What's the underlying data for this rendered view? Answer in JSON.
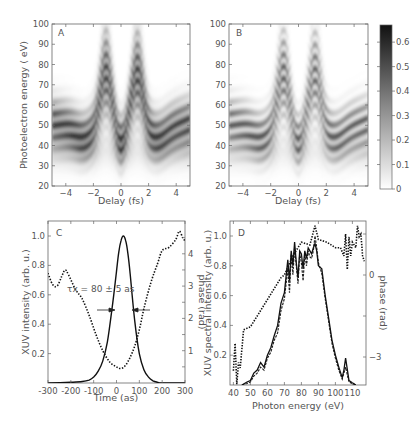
{
  "chart_data": [
    {
      "panel": "A",
      "type": "heatmap",
      "xlabel": "Delay (fs)",
      "ylabel": "Photoelectron energy ( eV)",
      "xlim": [
        -5,
        5
      ],
      "ylim": [
        20,
        100
      ],
      "xticks": [
        -4,
        -2,
        0,
        2,
        4
      ],
      "yticks": [
        20,
        30,
        40,
        50,
        60,
        70,
        80,
        90,
        100
      ],
      "description": "Measured streaking spectrogram: band centred ~55 eV oscillating with delay, peaks reaching ~88 eV near -1 fs and +1 fs, dip near 0 fs and minima ~40 eV",
      "peaks_delay_fs": [
        -1.1,
        1.2
      ],
      "peak_energy_eV": 88,
      "band_center_eV": 55
    },
    {
      "panel": "B",
      "type": "heatmap",
      "xlabel": "Delay (fs)",
      "ylabel": "",
      "xlim": [
        -5,
        5
      ],
      "ylim": [
        20,
        100
      ],
      "xticks": [
        -4,
        -2,
        0,
        2,
        4
      ],
      "yticks": [
        20,
        30,
        40,
        50,
        60,
        70,
        80,
        90,
        100
      ],
      "description": "Reconstructed streaking spectrogram with similar oscillation structure",
      "peaks_delay_fs": [
        -1.1,
        1.2
      ],
      "peak_energy_eV": 86,
      "band_center_eV": 55,
      "colorbar": {
        "range": [
          0,
          0.67
        ],
        "ticks": [
          0,
          0.1,
          0.2,
          0.3,
          0.4,
          0.5,
          0.6
        ]
      }
    },
    {
      "panel": "C",
      "type": "line",
      "xlabel": "Time (as)",
      "ylabel": "XUV intensity (arb. u.)",
      "y2label": "phase (rad)",
      "xlim": [
        -300,
        300
      ],
      "ylim": [
        0,
        1.1
      ],
      "y2lim": [
        0,
        4.75
      ],
      "xticks": [
        -300,
        -200,
        -100,
        0,
        100,
        200,
        300
      ],
      "yticks": [
        0.2,
        0.4,
        0.6,
        0.8,
        1.0
      ],
      "y2ticks": [
        1,
        2,
        3,
        4
      ],
      "annotation": "τx = 80 ± 5 as",
      "series": [
        {
          "name": "intensity",
          "style": "solid",
          "x": [
            -300,
            -200,
            -150,
            -120,
            -100,
            -80,
            -60,
            -40,
            -20,
            0,
            10,
            20,
            30,
            40,
            50,
            60,
            80,
            100,
            120,
            140,
            160,
            180,
            200,
            300
          ],
          "y": [
            0,
            0.005,
            0.01,
            0.02,
            0.04,
            0.08,
            0.15,
            0.28,
            0.5,
            0.76,
            0.89,
            0.97,
            1.0,
            0.97,
            0.88,
            0.74,
            0.42,
            0.2,
            0.09,
            0.04,
            0.015,
            0.005,
            0,
            0
          ]
        },
        {
          "name": "phase",
          "style": "dotted",
          "axis": "right",
          "x": [
            -300,
            -280,
            -260,
            -240,
            -225,
            -210,
            -180,
            -150,
            -120,
            -90,
            -60,
            -30,
            0,
            20,
            40,
            60,
            80,
            100,
            120,
            150,
            180,
            200,
            230,
            260,
            275,
            290,
            300
          ],
          "y": [
            3.4,
            3.05,
            3.0,
            3.3,
            3.5,
            3.35,
            2.9,
            2.6,
            2.1,
            1.5,
            1.0,
            0.65,
            0.5,
            0.45,
            0.55,
            0.8,
            1.15,
            1.65,
            2.3,
            3.1,
            3.7,
            4.1,
            4.2,
            4.45,
            4.7,
            4.5,
            4.4
          ]
        }
      ]
    },
    {
      "panel": "D",
      "type": "line",
      "xlabel": "Photon energy (eV)",
      "ylabel": "XUV spectral intensity (arb. u.)",
      "y2label": "phase (rad)",
      "xlim": [
        38,
        118
      ],
      "ylim": [
        0,
        1.1
      ],
      "xticks": [
        40,
        50,
        60,
        70,
        80,
        90,
        100,
        110
      ],
      "yticks": [
        0.2,
        0.4,
        0.6,
        0.8,
        1.0
      ],
      "y2ticks": [
        0,
        -3
      ],
      "series": [
        {
          "name": "spectrum (solid)",
          "style": "solid",
          "x": [
            45,
            48,
            50,
            52,
            54,
            56,
            58,
            60,
            62,
            64,
            66,
            68,
            70,
            72,
            73,
            74,
            75,
            76,
            77,
            78,
            79,
            80,
            81,
            82,
            83,
            84,
            85,
            86,
            87,
            88,
            89,
            90,
            92,
            94,
            96,
            98,
            100,
            102,
            104,
            105,
            106,
            108,
            112
          ],
          "y": [
            0,
            0.02,
            0.03,
            0.08,
            0.1,
            0.15,
            0.12,
            0.2,
            0.25,
            0.33,
            0.4,
            0.55,
            0.62,
            0.84,
            0.7,
            0.9,
            0.8,
            0.96,
            0.82,
            0.72,
            0.9,
            0.88,
            0.78,
            0.9,
            0.85,
            0.92,
            0.9,
            0.88,
            0.92,
            0.95,
            0.9,
            0.8,
            0.78,
            0.6,
            0.45,
            0.3,
            0.2,
            0.12,
            0.05,
            0.1,
            0.18,
            0.03,
            0
          ]
        },
        {
          "name": "spectrum (dashed)",
          "style": "dashed",
          "x": [
            45,
            48,
            50,
            52,
            54,
            56,
            58,
            60,
            62,
            64,
            66,
            68,
            70,
            72,
            73,
            74,
            75,
            76,
            77,
            78,
            79,
            80,
            81,
            82,
            83,
            84,
            85,
            86,
            87,
            88,
            89,
            90,
            92,
            94,
            96,
            98,
            100,
            102,
            104,
            106,
            108,
            112
          ],
          "y": [
            0,
            0.01,
            0.02,
            0.06,
            0.08,
            0.12,
            0.1,
            0.18,
            0.22,
            0.3,
            0.35,
            0.5,
            0.58,
            0.78,
            0.62,
            0.88,
            0.74,
            0.92,
            0.8,
            0.68,
            0.88,
            0.82,
            0.7,
            0.88,
            0.8,
            0.9,
            0.86,
            0.85,
            0.9,
            1.0,
            0.92,
            0.82,
            0.75,
            0.58,
            0.43,
            0.28,
            0.18,
            0.1,
            0.04,
            0.12,
            0.02,
            0
          ]
        },
        {
          "name": "phase",
          "style": "dotted",
          "axis": "right",
          "x": [
            40,
            41,
            42,
            43,
            44,
            46,
            50,
            55,
            60,
            65,
            68,
            70,
            75,
            80,
            85,
            88,
            90,
            95,
            100,
            103,
            105,
            106,
            107,
            108,
            109,
            110,
            112,
            113,
            114,
            115,
            116,
            117
          ],
          "y": [
            -3.5,
            -2.5,
            -4.0,
            -3.2,
            -3.4,
            -2.0,
            -1.9,
            -1.4,
            -0.9,
            -0.4,
            -0.1,
            0.0,
            0.7,
            1.2,
            1.1,
            1.8,
            1.3,
            1.2,
            1.0,
            1.0,
            0.7,
            1.5,
            0.2,
            1.4,
            0.7,
            1.2,
            1.0,
            1.8,
            1.4,
            1.5,
            0.7,
            0.5
          ]
        }
      ]
    }
  ],
  "panels": {
    "a": {
      "letter": "A",
      "xlabel": "Delay (fs)",
      "ylabel": "Photoelectron energy ( eV)"
    },
    "b": {
      "letter": "B",
      "xlabel": "Delay (fs)"
    },
    "c": {
      "letter": "C",
      "xlabel": "Time (as)",
      "ylabel": "XUV intensity (arb. u.)",
      "y2label": "phase (rad)",
      "annotation": "τx = 80 ± 5 as"
    },
    "d": {
      "letter": "D",
      "xlabel": "Photon energy (eV)",
      "ylabel": "XUV spectral intensity (arb. u.)",
      "y2label": "phase (rad)"
    }
  },
  "colors": {
    "ink": "#222222",
    "axis": "#666666",
    "text": "#555555",
    "heat_max": "#1a1a1a",
    "heat_min": "#ffffff"
  }
}
